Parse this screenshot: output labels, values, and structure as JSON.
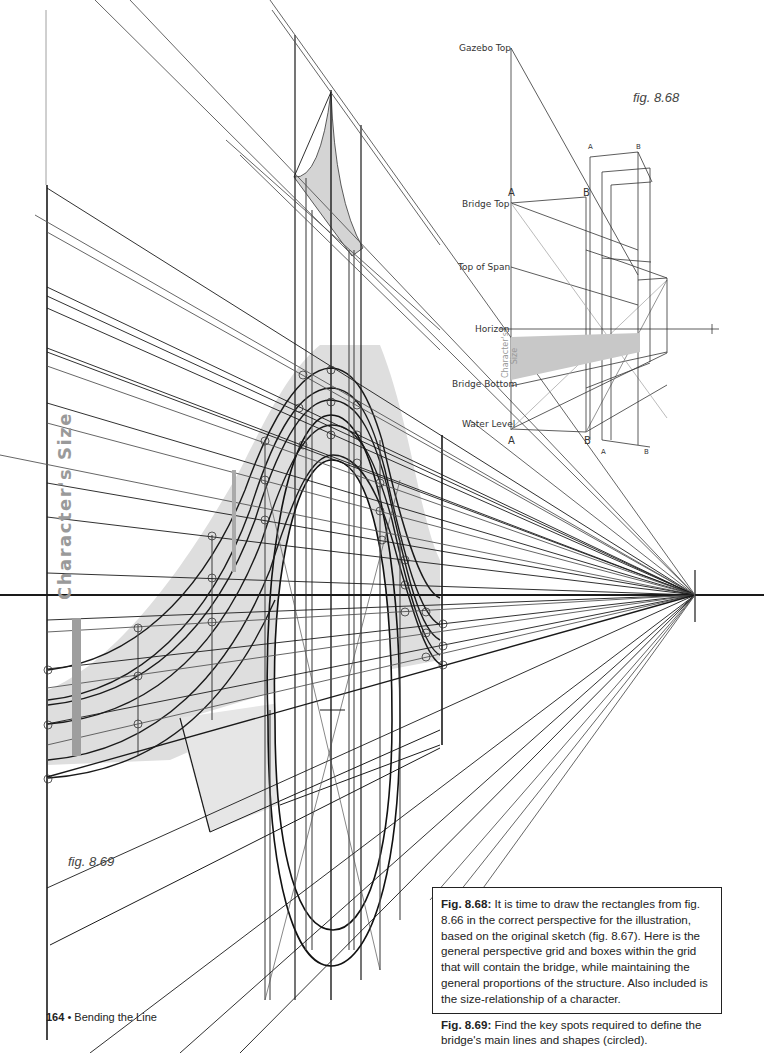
{
  "page": {
    "number": "164",
    "separator": "•",
    "book_section": "Bending the Line"
  },
  "fig_868": {
    "label": "fig. 8.68",
    "levels": {
      "gazebo_top": "Gazebo Top",
      "bridge_top": "Bridge Top",
      "top_of_span": "Top of Span",
      "horizon": "Horizon",
      "bridge_bottom": "Bridge Bottom",
      "water_level": "Water Level"
    },
    "character_size_label": "Character's Size",
    "corner_labels": {
      "front_top_a": "A",
      "front_top_b": "B",
      "front_bottom_a": "A",
      "front_bottom_b": "B",
      "back_top_a": "A",
      "back_top_b": "B",
      "back_bottom_a": "A",
      "back_bottom_b": "B"
    }
  },
  "fig_869": {
    "label": "fig. 8.69",
    "character_size_label": "Character's Size"
  },
  "caption": {
    "p1_title": "Fig. 8.68:",
    "p1_text": " It is time to draw the rectangles from fig. 8.66 in the correct perspective for the illustration, based on the original sketch (fig. 8.67). Here is the general perspective grid and boxes within the grid that will contain the bridge, while maintaining the general proportions of the structure. Also included is the size-relationship of a character.",
    "p2_title": "Fig. 8.69:",
    "p2_text": " Find the key spots required to define the bridge's main lines and shapes (circled)."
  },
  "colors": {
    "ink": "#1a1a1a",
    "shade": "#dcdcdc",
    "character_bar": "#9e9e9e",
    "label_gray": "#999999"
  },
  "vanishing_point": {
    "x": 695,
    "y": 595
  }
}
